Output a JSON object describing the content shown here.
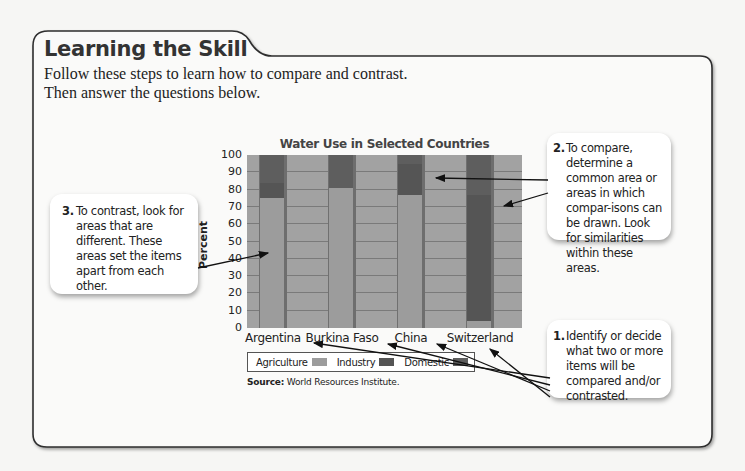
{
  "header": {
    "title": "Learning the Skill",
    "intro_line1": "Follow these steps to learn how to compare and contrast.",
    "intro_line2": "Then answer the questions below."
  },
  "callouts": [
    {
      "number": "1.",
      "text": "Identify or decide what two or more items will be compared and/or contrasted."
    },
    {
      "number": "2.",
      "text": "To compare, determine a common area or areas in which compar-isons can be drawn. Look for similarities within these areas."
    },
    {
      "number": "3.",
      "text": "To contrast, look for areas that are different. These areas set the items apart from each other."
    }
  ],
  "colors": {
    "agriculture": "#9c9c9c",
    "industry": "#555555",
    "domestic": "#5e5e5e",
    "plot_bg": "#a2a2a2",
    "frame": "#333333"
  },
  "chart_data": {
    "type": "bar",
    "stacked": true,
    "title": "Water Use in Selected Countries",
    "xlabel": "",
    "ylabel": "Percent",
    "ylim": [
      0,
      100
    ],
    "yticks": [
      0,
      10,
      20,
      30,
      40,
      50,
      60,
      70,
      80,
      90,
      100
    ],
    "grid": true,
    "categories": [
      "Argentina",
      "Burkina Faso",
      "China",
      "Switzerland"
    ],
    "series": [
      {
        "name": "Agriculture",
        "values": [
          75,
          81,
          77,
          4
        ]
      },
      {
        "name": "Industry",
        "values": [
          9,
          0,
          18,
          73
        ]
      },
      {
        "name": "Domestic",
        "values": [
          16,
          19,
          5,
          23
        ]
      }
    ],
    "legend": {
      "position": "bottom",
      "entries": [
        "Agriculture",
        "Industry",
        "Domestic"
      ]
    },
    "source_label": "Source:",
    "source_text": "World Resources Institute."
  }
}
